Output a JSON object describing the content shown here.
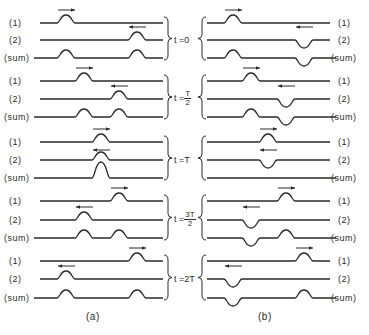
{
  "figure": {
    "panel_a": {
      "caption": "(a)",
      "description": "Two pulses of same sign traveling in opposite directions superpose"
    },
    "panel_b": {
      "caption": "(b)",
      "description": "Two pulses of opposite sign traveling in opposite directions superpose"
    },
    "row_labels": {
      "wave1": "(1)",
      "wave2": "(2)",
      "sum": "(sum)"
    },
    "time_steps": [
      {
        "prefix": "t =",
        "value": "0",
        "fraction": false
      },
      {
        "prefix": "t =",
        "numerator": "T",
        "denominator": "2",
        "fraction": true
      },
      {
        "prefix": "t =",
        "value": "T",
        "fraction": false
      },
      {
        "prefix": "t =",
        "numerator": "3T",
        "denominator": "2",
        "fraction": true
      },
      {
        "prefix": "t =",
        "value": "2T",
        "fraction": false
      }
    ],
    "colors": {
      "line": "#2a2a2a",
      "background": "#ffffff"
    }
  }
}
